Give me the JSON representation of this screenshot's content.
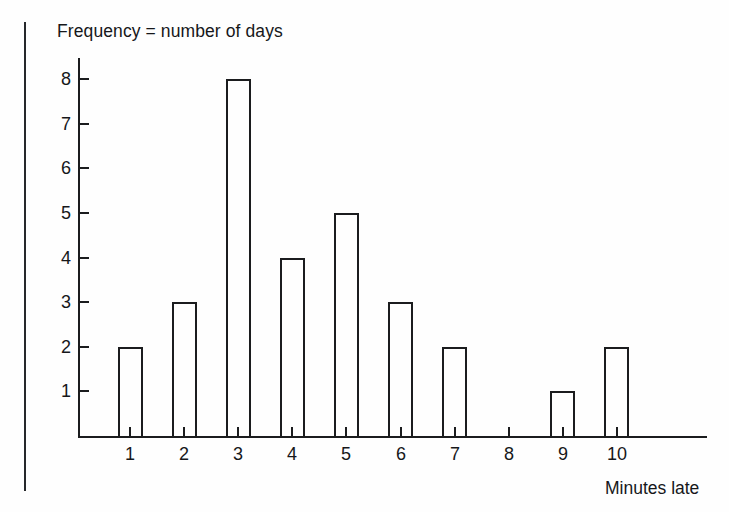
{
  "chart_data": {
    "type": "bar",
    "title": "Frequency = number of days",
    "xlabel": "Minutes late",
    "ylabel": "Frequency = number of days",
    "categories": [
      "1",
      "2",
      "3",
      "4",
      "5",
      "6",
      "7",
      "8",
      "9",
      "10"
    ],
    "values": [
      2,
      3,
      8,
      4,
      5,
      3,
      2,
      0,
      1,
      2
    ],
    "ytick_labels": [
      "1",
      "2",
      "3",
      "4",
      "5",
      "6",
      "7",
      "8"
    ],
    "ytick_values": [
      1,
      2,
      3,
      4,
      5,
      6,
      7,
      8
    ],
    "ylim": [
      0,
      8.5
    ],
    "xlim": [
      0.4,
      11.6
    ],
    "grid": false,
    "legend": null,
    "bar_style": "outline",
    "colors": {
      "axis": "#1b1c1e",
      "bar_outline": "#1b1c1e",
      "bar_fill": "transparent",
      "text": "#16171a",
      "background": "#fefefe",
      "margin_rule": "#26282b"
    }
  },
  "figure": {
    "title": "Frequency = number of days",
    "x_axis_title": "Minutes late"
  }
}
